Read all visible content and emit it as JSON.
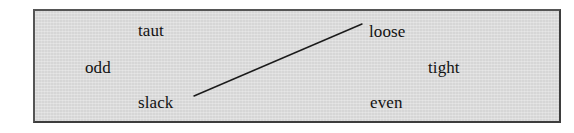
{
  "figure": {
    "panel": {
      "background_color": "#d6d6d6",
      "border_color": "#4a4a4a"
    },
    "words": [
      {
        "id": "taut",
        "label": "taut",
        "x": 136,
        "y": 20
      },
      {
        "id": "loose",
        "label": "loose",
        "x": 367,
        "y": 21
      },
      {
        "id": "odd",
        "label": "odd",
        "x": 83,
        "y": 57
      },
      {
        "id": "tight",
        "label": "tight",
        "x": 426,
        "y": 57
      },
      {
        "id": "slack",
        "label": "slack",
        "x": 136,
        "y": 92
      },
      {
        "id": "even",
        "label": "even",
        "x": 368,
        "y": 92
      }
    ],
    "connections": [
      {
        "id": "slack-to-loose",
        "from": "slack",
        "to": "loose",
        "x1": 194,
        "y1": 96,
        "x2": 362,
        "y2": 24,
        "color": "#1a1a1a",
        "width": 1.4
      }
    ]
  }
}
